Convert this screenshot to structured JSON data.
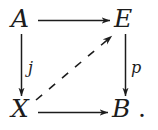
{
  "diagram": {
    "kind": "commutative-square",
    "background_color": "#ffffff",
    "ink_color": "#1c1c1c",
    "trailing_punctuation": ".",
    "nodes": [
      {
        "id": "A",
        "label": "A",
        "position": "top-left",
        "x": 22,
        "y": 19
      },
      {
        "id": "E",
        "label": "E",
        "position": "top-right",
        "x": 125,
        "y": 19
      },
      {
        "id": "X",
        "label": "X",
        "position": "bottom-left",
        "x": 22,
        "y": 109
      },
      {
        "id": "B",
        "label": "B",
        "position": "bottom-right",
        "x": 124,
        "y": 109
      }
    ],
    "edges": [
      {
        "id": "A-to-E",
        "from": "A",
        "to": "E",
        "label": "",
        "style": "solid",
        "direction": "right",
        "arrowhead": "end"
      },
      {
        "id": "A-to-X",
        "from": "A",
        "to": "X",
        "label": "j",
        "style": "solid",
        "direction": "down",
        "arrowhead": "end"
      },
      {
        "id": "E-to-B",
        "from": "E",
        "to": "B",
        "label": "p",
        "style": "solid",
        "direction": "down",
        "arrowhead": "end"
      },
      {
        "id": "X-to-B",
        "from": "X",
        "to": "B",
        "label": "",
        "style": "solid",
        "direction": "right",
        "arrowhead": "end"
      },
      {
        "id": "X-to-E",
        "from": "X",
        "to": "E",
        "label": "",
        "style": "dashed",
        "direction": "diagonal-up-right",
        "arrowhead": "end"
      }
    ]
  }
}
